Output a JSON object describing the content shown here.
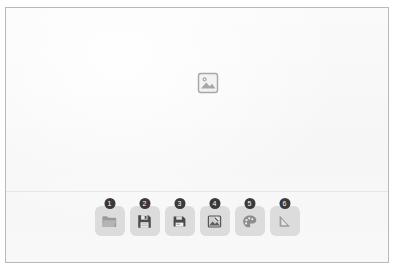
{
  "frame": {
    "border_color": "#b9b9b9",
    "background_color": "#f8f8f8"
  },
  "canvas": {
    "placeholder": {
      "icon": "broken-image-icon",
      "alt_text": ""
    },
    "background_color": "#f8f8f8"
  },
  "divider": {
    "color": "#e6e6e6"
  },
  "toolbar": {
    "tile_color": "#dcdcdc",
    "badge_color": "#3a3a3a",
    "badge_text_color": "#ffffff",
    "icon_color": "#6f6f6f",
    "items": [
      {
        "badge": "1",
        "icon": "folder-icon",
        "label": ""
      },
      {
        "badge": "2",
        "icon": "save-icon",
        "label": ""
      },
      {
        "badge": "3",
        "icon": "save-as-icon",
        "label": ""
      },
      {
        "badge": "4",
        "icon": "image-edit-icon",
        "label": ""
      },
      {
        "badge": "5",
        "icon": "palette-icon",
        "label": ""
      },
      {
        "badge": "6",
        "icon": "set-square-icon",
        "label": ""
      }
    ]
  }
}
